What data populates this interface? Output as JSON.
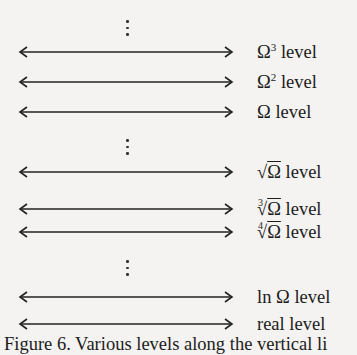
{
  "diagram": {
    "levels": [
      {
        "label_prefix": "Ω",
        "sup": "3",
        "label_suffix": " level",
        "y": 42
      },
      {
        "label_prefix": "Ω",
        "sup": "2",
        "label_suffix": " level",
        "y": 72
      },
      {
        "label_prefix": "Ω",
        "sup": "",
        "label_suffix": " level",
        "y": 102
      },
      {
        "root_index": "",
        "radicand": "Ω",
        "label_suffix": " level",
        "y": 162
      },
      {
        "root_index": "3",
        "radicand": "Ω",
        "label_suffix": " level",
        "y": 199
      },
      {
        "root_index": "4",
        "radicand": "Ω",
        "label_suffix": " level",
        "y": 222
      },
      {
        "label": "ln Ω level",
        "y": 287
      },
      {
        "label": "real level",
        "y": 314
      }
    ],
    "ellipses": [
      {
        "y": 18
      },
      {
        "y": 139
      },
      {
        "y": 260
      }
    ],
    "caption": "Figure 6. Various levels along the vertical li"
  }
}
